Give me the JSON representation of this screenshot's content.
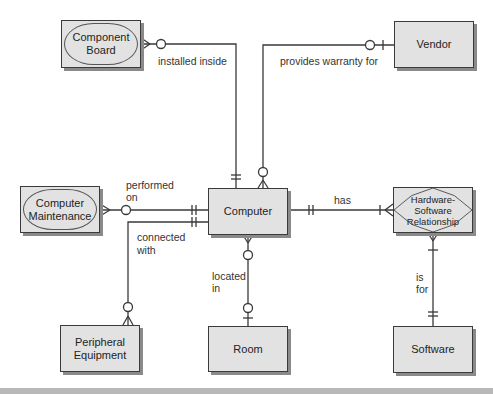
{
  "entities": {
    "component_board": "Component Board",
    "vendor": "Vendor",
    "computer_maintenance": "Computer Maintenance",
    "computer": "Computer",
    "hw_sw_relationship": "Hardware-Software Relationship",
    "peripheral_equipment": "Peripheral Equipment",
    "room": "Room",
    "software": "Software"
  },
  "entity_lines": {
    "component_board": [
      "Component",
      "Board"
    ],
    "computer_maintenance": [
      "Computer",
      "Maintenance"
    ],
    "hw_sw_relationship": [
      "Hardware-",
      "Software",
      "Relationship"
    ],
    "peripheral_equipment": [
      "Peripheral",
      "Equipment"
    ]
  },
  "relationships": {
    "installed_inside": "installed inside",
    "provides_warranty_for": "provides warranty for",
    "performed_on_1": "performed",
    "performed_on_2": "on",
    "connected_with_1": "connected",
    "connected_with_2": "with",
    "has": "has",
    "located_in_1": "located",
    "located_in_2": "in",
    "is_for_1": "is",
    "is_for_2": "for"
  },
  "colors": {
    "entity_fill": "#e2e2e2",
    "line": "#3a3a3a",
    "shadow": "#8a8a8a"
  }
}
